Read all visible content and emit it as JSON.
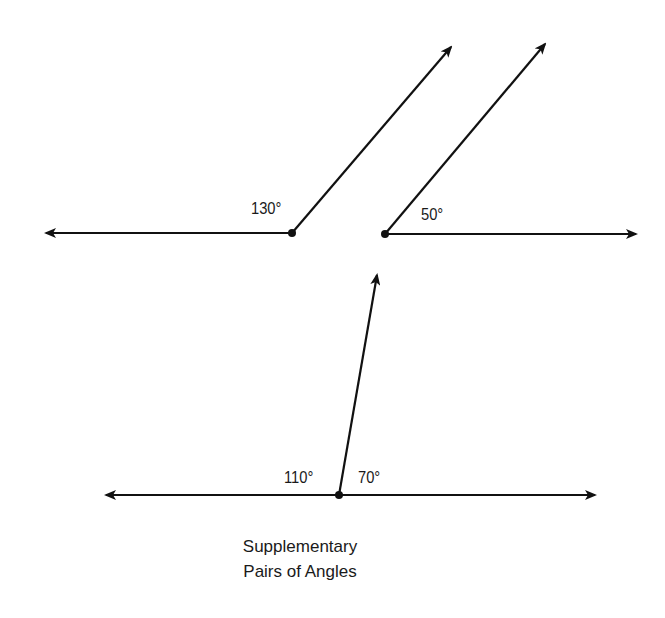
{
  "diagram": {
    "caption_line1": "Supplementary",
    "caption_line2": "Pairs of Angles",
    "pairs": [
      {
        "angle_label": "130°",
        "degrees": 130
      },
      {
        "angle_label": "50°",
        "degrees": 50
      },
      {
        "left_angle_label": "110°",
        "left_degrees": 110,
        "right_angle_label": "70°",
        "right_degrees": 70
      }
    ],
    "colors": {
      "stroke": "#111111",
      "background": "#ffffff"
    }
  }
}
